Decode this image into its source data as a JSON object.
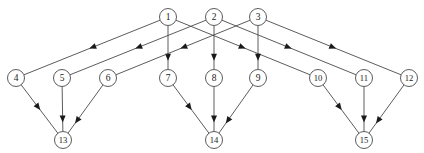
{
  "figure": {
    "width": 424,
    "height": 153,
    "background_color": "#ffffff",
    "node_stroke_color": "#4a4a4a",
    "node_fill_color": "#ffffff",
    "edge_color": "#4a4a4a",
    "arrow_color": "#1a1a1a",
    "label_color": "#1a1a1a",
    "node_radius": 8.5
  },
  "chart_data": {
    "type": "diagram",
    "layers": [
      {
        "name": "sources",
        "node_ids": [
          1,
          2,
          3
        ],
        "y": 17
      },
      {
        "name": "middle",
        "node_ids": [
          4,
          5,
          6,
          7,
          8,
          9,
          10,
          11,
          12
        ],
        "y": 78
      },
      {
        "name": "sinks",
        "node_ids": [
          13,
          14,
          15
        ],
        "y": 140
      }
    ],
    "nodes": [
      {
        "id": 1,
        "label": "1",
        "x": 168,
        "y": 17
      },
      {
        "id": 2,
        "label": "2",
        "x": 214,
        "y": 17
      },
      {
        "id": 3,
        "label": "3",
        "x": 258,
        "y": 17
      },
      {
        "id": 4,
        "label": "4",
        "x": 16,
        "y": 78
      },
      {
        "id": 5,
        "label": "5",
        "x": 62,
        "y": 78
      },
      {
        "id": 6,
        "label": "6",
        "x": 108,
        "y": 78
      },
      {
        "id": 7,
        "label": "7",
        "x": 168,
        "y": 78
      },
      {
        "id": 8,
        "label": "8",
        "x": 214,
        "y": 78
      },
      {
        "id": 9,
        "label": "9",
        "x": 258,
        "y": 78
      },
      {
        "id": 10,
        "label": "10",
        "x": 318,
        "y": 78
      },
      {
        "id": 11,
        "label": "11",
        "x": 364,
        "y": 78
      },
      {
        "id": 12,
        "label": "12",
        "x": 409,
        "y": 78
      },
      {
        "id": 13,
        "label": "13",
        "x": 63,
        "y": 140
      },
      {
        "id": 14,
        "label": "14",
        "x": 214,
        "y": 140
      },
      {
        "id": 15,
        "label": "15",
        "x": 364,
        "y": 140
      }
    ],
    "edges": [
      {
        "from": 1,
        "to": 4,
        "directed": true
      },
      {
        "from": 1,
        "to": 7,
        "directed": true
      },
      {
        "from": 1,
        "to": 10,
        "directed": true
      },
      {
        "from": 2,
        "to": 5,
        "directed": true
      },
      {
        "from": 2,
        "to": 8,
        "directed": true
      },
      {
        "from": 2,
        "to": 11,
        "directed": true
      },
      {
        "from": 3,
        "to": 6,
        "directed": true
      },
      {
        "from": 3,
        "to": 9,
        "directed": true
      },
      {
        "from": 3,
        "to": 12,
        "directed": true
      },
      {
        "from": 4,
        "to": 13,
        "directed": true
      },
      {
        "from": 5,
        "to": 13,
        "directed": true
      },
      {
        "from": 6,
        "to": 13,
        "directed": true
      },
      {
        "from": 7,
        "to": 14,
        "directed": true
      },
      {
        "from": 8,
        "to": 14,
        "directed": true
      },
      {
        "from": 9,
        "to": 14,
        "directed": true
      },
      {
        "from": 10,
        "to": 15,
        "directed": true
      },
      {
        "from": 11,
        "to": 15,
        "directed": true
      },
      {
        "from": 12,
        "to": 15,
        "directed": true
      }
    ]
  }
}
